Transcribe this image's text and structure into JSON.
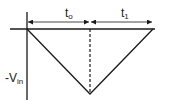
{
  "diagram": {
    "type": "timing-waveform",
    "labels": {
      "t0_main": "t",
      "t0_sub": "o",
      "t1_main": "t",
      "t1_sub": "1",
      "vin_main": "-V",
      "vin_sub": "in"
    },
    "colors": {
      "line": "#1a1a1a",
      "background": "#ffffff"
    }
  }
}
